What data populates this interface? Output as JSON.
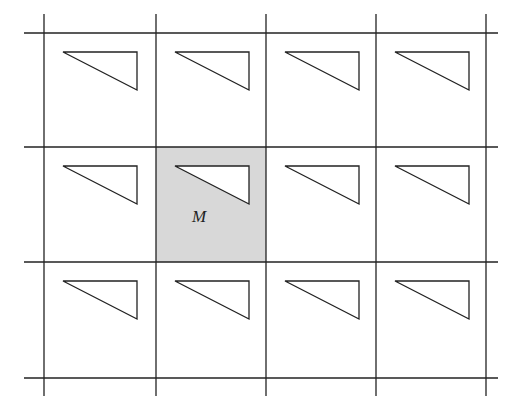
{
  "diagram": {
    "type": "lattice-tiling",
    "colors": {
      "line": "#222222",
      "shade": "#d8d8d8",
      "background": "#ffffff",
      "triangle_fill": "#ffffff"
    },
    "grid": {
      "columns": 4,
      "rows": 3,
      "vertical_lines_x": [
        44,
        156,
        266,
        376,
        486
      ],
      "horizontal_lines_y": [
        33,
        147,
        262,
        378
      ],
      "line_extent_x": [
        24,
        498
      ],
      "line_extent_y": [
        14,
        396
      ]
    },
    "motif": {
      "shape": "right-triangle",
      "offset_from_cell_top_left": [
        19,
        19
      ],
      "vertices_relative": [
        [
          0,
          0
        ],
        [
          74,
          0
        ],
        [
          74,
          38
        ]
      ]
    },
    "highlighted_cell": {
      "row": 1,
      "col": 1,
      "label": "M",
      "label_position": [
        199,
        222
      ]
    }
  }
}
